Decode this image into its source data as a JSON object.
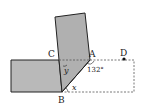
{
  "diagram": {
    "labels": {
      "A": "A",
      "B": "B",
      "C": "C",
      "D": "D",
      "x": "x",
      "y": "y",
      "angle": "132°"
    },
    "colors": {
      "fill": "#b9b9b9",
      "stroke": "#222222",
      "dashed": "#555555"
    }
  }
}
